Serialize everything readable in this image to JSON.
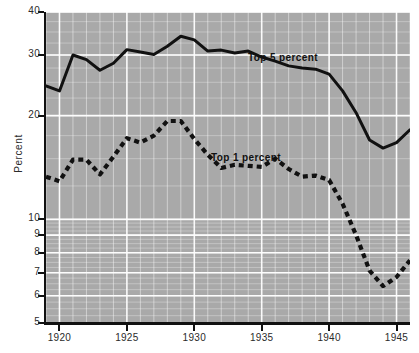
{
  "chart_data": {
    "type": "line",
    "title": "",
    "subtitle": "",
    "xlabel": "",
    "ylabel": "Percent",
    "yscale": "log",
    "ylim": [
      5,
      40
    ],
    "xlim": [
      1919,
      1946
    ],
    "grid": true,
    "legend_position": "inline-annotations",
    "y_tick_labels": [
      "40",
      "30",
      "20",
      "10",
      "9",
      "8",
      "7",
      "6",
      "5"
    ],
    "y_tick_values": [
      40,
      30,
      20,
      10,
      9,
      8,
      7,
      6,
      5
    ],
    "x_tick_labels": [
      "1920",
      "1925",
      "1930",
      "1935",
      "1940",
      "1945"
    ],
    "x_tick_values": [
      1920,
      1925,
      1930,
      1935,
      1940,
      1945
    ],
    "x": [
      1919,
      1920,
      1921,
      1922,
      1923,
      1924,
      1925,
      1926,
      1927,
      1928,
      1929,
      1930,
      1931,
      1932,
      1933,
      1934,
      1935,
      1936,
      1937,
      1938,
      1939,
      1940,
      1941,
      1942,
      1943,
      1944,
      1945,
      1946
    ],
    "series": [
      {
        "name": "Top 5 percent",
        "style": "solid",
        "color": "#111111",
        "values": [
          24.4,
          23.6,
          30.0,
          29.1,
          27.1,
          28.4,
          31.1,
          30.6,
          30.1,
          31.8,
          34.0,
          33.2,
          30.8,
          31.0,
          30.4,
          30.8,
          29.6,
          28.8,
          27.9,
          27.5,
          27.3,
          26.4,
          23.6,
          20.4,
          17.0,
          16.1,
          16.7,
          18.2
        ]
      },
      {
        "name": "Top 1 percent",
        "style": "dashed",
        "color": "#111111",
        "values": [
          13.3,
          12.9,
          14.9,
          14.9,
          13.5,
          15.2,
          17.2,
          16.7,
          17.5,
          19.3,
          19.3,
          17.1,
          15.4,
          14.1,
          14.4,
          14.3,
          14.2,
          15.0,
          14.0,
          13.3,
          13.4,
          13.0,
          11.1,
          9.0,
          7.1,
          6.4,
          6.8,
          7.6
        ]
      }
    ],
    "annotations": [
      {
        "text": "Top 5 percent",
        "series": "Top 5 percent"
      },
      {
        "text": "Top 1 percent",
        "series": "Top 1 percent"
      }
    ],
    "plot_background_color": "#a9a9a9",
    "gridline_color": "#ffffff",
    "axis_color": "#111111"
  }
}
